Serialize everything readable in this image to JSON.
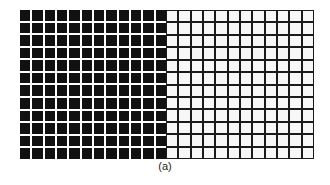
{
  "figure": {
    "caption": "(a)",
    "left_grid": {
      "rows": 12,
      "columns": 12,
      "cell_color": "#111111",
      "gap_color": "#ffffff",
      "description": "black squares separated by white gaps"
    },
    "right_grid": {
      "rows": 12,
      "columns": 12,
      "cell_color": "#f7f7f7",
      "line_color": "#1a1a1a",
      "description": "white squares separated by black grid lines"
    }
  }
}
